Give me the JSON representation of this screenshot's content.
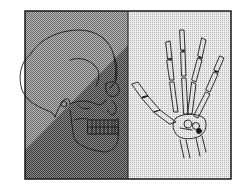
{
  "figure": {
    "panels": [
      {
        "name": "skull-panel",
        "subject": "skull-profile",
        "background": "dark-halftone"
      },
      {
        "name": "hand-panel",
        "subject": "hand-skeleton",
        "background": "light-halftone"
      }
    ],
    "colors": {
      "ink": "#1a1a1a",
      "left_light": "#9a9a9a",
      "left_dark": "#6e6e6e",
      "right_bg": "#d6d6d6",
      "page": "#ffffff"
    }
  }
}
